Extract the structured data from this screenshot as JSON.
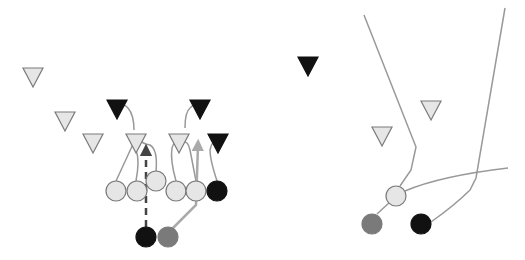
{
  "colors": {
    "background": "#ffffff",
    "light_fill": "#e6e6e6",
    "dark_fill": "#111111",
    "medium_fill": "#7a7a7a",
    "outline": "#7a7a7a",
    "route_line": "#999999",
    "route_dark": "#444444"
  },
  "left_play": {
    "defenders": [
      {
        "id": "d1",
        "x": 33,
        "y": 76,
        "fill": "light"
      },
      {
        "id": "d2",
        "x": 65,
        "y": 120,
        "fill": "light"
      },
      {
        "id": "d3",
        "x": 93,
        "y": 142,
        "fill": "light"
      },
      {
        "id": "d4",
        "x": 117,
        "y": 108,
        "fill": "dark"
      },
      {
        "id": "d5",
        "x": 136,
        "y": 142,
        "fill": "light"
      },
      {
        "id": "d6",
        "x": 179,
        "y": 142,
        "fill": "light"
      },
      {
        "id": "d7",
        "x": 200,
        "y": 108,
        "fill": "dark"
      },
      {
        "id": "d8",
        "x": 218,
        "y": 142,
        "fill": "dark"
      }
    ],
    "offense": [
      {
        "id": "o1",
        "x": 116,
        "y": 191,
        "fill": "light"
      },
      {
        "id": "o2",
        "x": 137,
        "y": 191,
        "fill": "light"
      },
      {
        "id": "o3",
        "x": 156,
        "y": 181,
        "fill": "light"
      },
      {
        "id": "o4",
        "x": 176,
        "y": 191,
        "fill": "light"
      },
      {
        "id": "o5",
        "x": 196,
        "y": 191,
        "fill": "light"
      },
      {
        "id": "o6",
        "x": 217,
        "y": 191,
        "fill": "dark"
      },
      {
        "id": "o7",
        "x": 146,
        "y": 237,
        "fill": "dark"
      },
      {
        "id": "o8",
        "x": 168,
        "y": 237,
        "fill": "medium"
      }
    ],
    "routes": [
      {
        "id": "r1",
        "d": "M116 181 L134 142",
        "style": "solid"
      },
      {
        "id": "r2",
        "d": "M136 181 Q140 160 136 150",
        "style": "solid"
      },
      {
        "id": "r3",
        "d": "M156 171 Q158 150 150 145 Q143 144 140 140",
        "style": "solid"
      },
      {
        "id": "r4",
        "d": "M176 181 Q170 160 172 148 Q174 140 180 142",
        "style": "solid"
      },
      {
        "id": "r5",
        "d": "M196 181 Q192 160 190 150 Q188 140 182 142",
        "style": "solid"
      },
      {
        "id": "r6",
        "d": "M217 181 Q210 160 210 150 Q212 140 218 140",
        "style": "solid"
      },
      {
        "id": "r7",
        "d": "M134 130 Q134 115 128 108 Q124 104 120 104",
        "style": "solid"
      },
      {
        "id": "r8",
        "d": "M185 128 Q185 112 190 108 Q194 104 198 104",
        "style": "solid"
      },
      {
        "id": "r9",
        "d": "M146 227 L146 150",
        "style": "dashed-dark-arrow"
      },
      {
        "id": "r10",
        "d": "M172 229 L196 205 L198 145",
        "style": "light-arrow"
      }
    ]
  },
  "right_play": {
    "defenders": [
      {
        "id": "rd1",
        "x": 308,
        "y": 65,
        "fill": "dark"
      },
      {
        "id": "rd2",
        "x": 431,
        "y": 109,
        "fill": "light"
      },
      {
        "id": "rd3",
        "x": 382,
        "y": 135,
        "fill": "light"
      }
    ],
    "offense": [
      {
        "id": "ro1",
        "x": 396,
        "y": 196,
        "fill": "light"
      },
      {
        "id": "ro2",
        "x": 372,
        "y": 224,
        "fill": "medium"
      },
      {
        "id": "ro3",
        "x": 421,
        "y": 224,
        "fill": "dark"
      }
    ],
    "routes": [
      {
        "id": "rr1",
        "d": "M364 15 L416 147 L411 170 L400 186",
        "style": "solid"
      },
      {
        "id": "rr2",
        "d": "M377 214 L390 202",
        "style": "solid"
      },
      {
        "id": "rr3",
        "d": "M405 191 Q440 176 508 168",
        "style": "solid"
      },
      {
        "id": "rr4",
        "d": "M431 222 Q455 205 470 190 L476 178 L505 8",
        "style": "solid"
      }
    ]
  }
}
